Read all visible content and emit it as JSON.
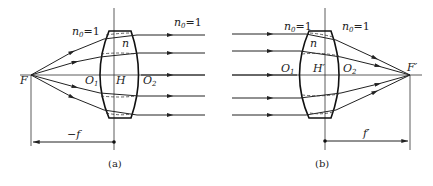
{
  "figure_a": {
    "caption": "(a)",
    "focal_point_label": "F",
    "medium_left_label": "n",
    "medium_left_sub": "0",
    "medium_left_value": "=1",
    "medium_right_label": "n",
    "medium_right_sub": "0",
    "medium_right_value": "=1",
    "lens_index_label": "n",
    "vertex_left_label": "O",
    "vertex_left_sub": "1",
    "principal_point_label": "H",
    "vertex_right_label": "O",
    "vertex_right_sub": "2",
    "focal_length_label": "−f"
  },
  "figure_b": {
    "caption": "(b)",
    "focal_point_label": "F′",
    "medium_left_label": "n",
    "medium_left_sub": "0",
    "medium_left_value": "=1",
    "medium_right_label": "n",
    "medium_right_sub": "0",
    "medium_right_value": "=1",
    "lens_index_label": "n",
    "vertex_left_label": "O",
    "vertex_left_sub": "1",
    "principal_point_label": "H′",
    "vertex_right_label": "O",
    "vertex_right_sub": "2",
    "focal_length_label": "f′"
  },
  "colors": {
    "line": "#222222",
    "background": "#ffffff"
  }
}
